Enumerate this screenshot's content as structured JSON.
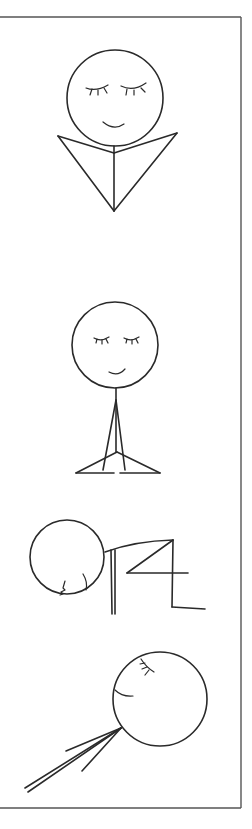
{
  "illustration": {
    "description": "Four stick-figure poses drawn in black line art inside a partial frame",
    "colors": {
      "ink": "#2a2a2a",
      "frame": "#555555",
      "background": "#ffffff"
    },
    "figures": [
      {
        "id": "pose-1",
        "label": "seated figure with arms forming a V shape",
        "expression": "eyes closed, smiling"
      },
      {
        "id": "pose-2",
        "label": "seated cross-legged figure with hands pressed together",
        "expression": "eyes closed, smiling"
      },
      {
        "id": "pose-3",
        "label": "figure bent forward in a kneeling fold",
        "expression": "face turned down"
      },
      {
        "id": "pose-4",
        "label": "figure lying back with limbs extended diagonally",
        "expression": "eyes closed, smiling"
      }
    ]
  }
}
